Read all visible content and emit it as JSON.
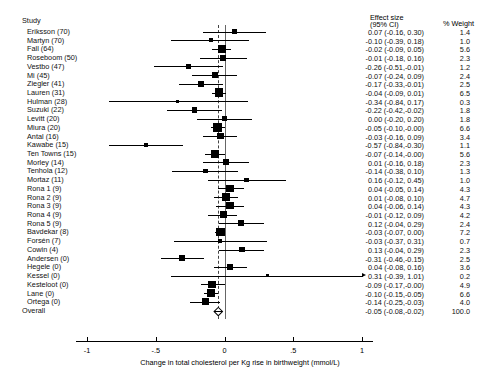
{
  "headers": {
    "study": "Study",
    "effect_size_line1": "Effect size",
    "effect_size_line2": "(95% CI)",
    "weight": "% Weight"
  },
  "axis": {
    "title": "Change in total cholesterol per Kg rise in birthweight (mmol/L)",
    "ticks": [
      "-1",
      "-.5",
      "0",
      ".5",
      "1"
    ],
    "tick_values": [
      -1,
      -0.5,
      0,
      0.5,
      1
    ],
    "xlim": [
      -1.08,
      1.08
    ]
  },
  "overall": {
    "label": "Overall",
    "effect": "-0.05 (-0.08,-0.02)",
    "weight": "100.0"
  },
  "chart_data": {
    "type": "forest",
    "title": "",
    "xlabel": "Change in total cholesterol per Kg rise in birthweight (mmol/L)",
    "ylabel": "",
    "xlim": [
      -1.08,
      1.08
    ],
    "ticks": [
      -1,
      -0.5,
      0,
      0.5,
      1
    ],
    "null_line": 0,
    "pooled_line": -0.05,
    "columns": [
      "Study",
      "Effect size (95% CI)",
      "% Weight"
    ],
    "rows": [
      {
        "study": "Eriksson (70)",
        "est": 0.07,
        "lo": -0.16,
        "hi": 0.3,
        "weight": 1.4,
        "effect": "0.07 (-0.16, 0.30)",
        "weight_label": "1.4"
      },
      {
        "study": "Martyn (70)",
        "est": -0.1,
        "lo": -0.39,
        "hi": 0.18,
        "weight": 1.0,
        "effect": "-0.10 (-0.39, 0.18)",
        "weight_label": "1.0"
      },
      {
        "study": "Fall (64)",
        "est": -0.02,
        "lo": -0.09,
        "hi": 0.05,
        "weight": 5.6,
        "effect": "-0.02 (-0.09, 0.05)",
        "weight_label": "5.6"
      },
      {
        "study": "Roseboom (50)",
        "est": -0.01,
        "lo": -0.18,
        "hi": 0.16,
        "weight": 2.3,
        "effect": "-0.01 (-0.18, 0.16)",
        "weight_label": "2.3"
      },
      {
        "study": "Vestbo (47)",
        "est": -0.26,
        "lo": -0.51,
        "hi": -0.01,
        "weight": 1.2,
        "effect": "-0.26 (-0.51,-0.01)",
        "weight_label": "1.2"
      },
      {
        "study": "Mi (45)",
        "est": -0.07,
        "lo": -0.24,
        "hi": 0.09,
        "weight": 2.4,
        "effect": "-0.07 (-0.24, 0.09)",
        "weight_label": "2.4"
      },
      {
        "study": "Ziegler (41)",
        "est": -0.17,
        "lo": -0.33,
        "hi": -0.01,
        "weight": 2.5,
        "effect": "-0.17 (-0.33,-0.01)",
        "weight_label": "2.5"
      },
      {
        "study": "Lauren (31)",
        "est": -0.04,
        "lo": -0.09,
        "hi": 0.01,
        "weight": 6.5,
        "effect": "-0.04 (-0.09, 0.01)",
        "weight_label": "6.5"
      },
      {
        "study": "Hulman (28)",
        "est": -0.34,
        "lo": -0.84,
        "hi": 0.17,
        "weight": 0.3,
        "effect": "-0.34 (-0.84, 0.17)",
        "weight_label": "0.3"
      },
      {
        "study": "Suzuki (22)",
        "est": -0.22,
        "lo": -0.42,
        "hi": -0.02,
        "weight": 1.8,
        "effect": "-0.22 (-0.42,-0.02)",
        "weight_label": "1.8"
      },
      {
        "study": "Levitt (20)",
        "est": 0.0,
        "lo": -0.2,
        "hi": 0.2,
        "weight": 1.8,
        "effect": "0.00 (-0.20, 0.20)",
        "weight_label": "1.8"
      },
      {
        "study": "Miura (20)",
        "est": -0.05,
        "lo": -0.1,
        "hi": -0.0,
        "weight": 6.6,
        "effect": "-0.05 (-0.10,-0.00)",
        "weight_label": "6.6"
      },
      {
        "study": "Antal (16)",
        "est": -0.03,
        "lo": -0.16,
        "hi": 0.09,
        "weight": 3.4,
        "effect": "-0.03 (-0.16, 0.09)",
        "weight_label": "3.4"
      },
      {
        "study": "Kawabe (15)",
        "est": -0.57,
        "lo": -0.84,
        "hi": -0.3,
        "weight": 1.1,
        "effect": "-0.57 (-0.84,-0.30)",
        "weight_label": "1.1"
      },
      {
        "study": "Ten Towns (15)",
        "est": -0.07,
        "lo": -0.14,
        "hi": -0.0,
        "weight": 5.6,
        "effect": "-0.07 (-0.14,-0.00)",
        "weight_label": "5.6"
      },
      {
        "study": "Morley (14)",
        "est": 0.01,
        "lo": -0.16,
        "hi": 0.18,
        "weight": 2.3,
        "effect": "0.01 (-0.16, 0.18)",
        "weight_label": "2.3"
      },
      {
        "study": "Tenhola (12)",
        "est": -0.14,
        "lo": -0.38,
        "hi": 0.1,
        "weight": 1.3,
        "effect": "-0.14 (-0.38, 0.10)",
        "weight_label": "1.3"
      },
      {
        "study": "Mortaz (11)",
        "est": 0.16,
        "lo": -0.12,
        "hi": 0.45,
        "weight": 1.0,
        "effect": "0.16 (-0.12, 0.45)",
        "weight_label": "1.0"
      },
      {
        "study": "Rona 1 (9)",
        "est": 0.04,
        "lo": -0.05,
        "hi": 0.14,
        "weight": 4.3,
        "effect": "0.04 (-0.05, 0.14)",
        "weight_label": "4.3"
      },
      {
        "study": "Rona 2 (9)",
        "est": 0.01,
        "lo": -0.08,
        "hi": 0.1,
        "weight": 4.7,
        "effect": "0.01 (-0.08, 0.10)",
        "weight_label": "4.7"
      },
      {
        "study": "Rona 3 (9)",
        "est": 0.04,
        "lo": -0.06,
        "hi": 0.14,
        "weight": 4.3,
        "effect": "0.04 (-0.06, 0.14)",
        "weight_label": "4.3"
      },
      {
        "study": "Rona 4 (9)",
        "est": -0.01,
        "lo": -0.12,
        "hi": 0.09,
        "weight": 4.2,
        "effect": "-0.01 (-0.12, 0.09)",
        "weight_label": "4.2"
      },
      {
        "study": "Rona 5 (9)",
        "est": 0.12,
        "lo": -0.04,
        "hi": 0.29,
        "weight": 2.4,
        "effect": "0.12 (-0.04, 0.29)",
        "weight_label": "2.4"
      },
      {
        "study": "Bavdekar (8)",
        "est": -0.03,
        "lo": -0.07,
        "hi": 0.0,
        "weight": 7.2,
        "effect": "-0.03 (-0.07, 0.00)",
        "weight_label": "7.2"
      },
      {
        "study": "Forsén (7)",
        "est": -0.03,
        "lo": -0.37,
        "hi": 0.31,
        "weight": 0.7,
        "effect": "-0.03 (-0.37, 0.31)",
        "weight_label": "0.7"
      },
      {
        "study": "Cowin (4)",
        "est": 0.13,
        "lo": -0.04,
        "hi": 0.29,
        "weight": 2.3,
        "effect": "0.13 (-0.04, 0.29)",
        "weight_label": "2.3"
      },
      {
        "study": "Andersen (0)",
        "est": -0.31,
        "lo": -0.46,
        "hi": -0.15,
        "weight": 2.5,
        "effect": "-0.31 (-0.46,-0.15)",
        "weight_label": "2.5"
      },
      {
        "study": "Hegele (0)",
        "est": 0.04,
        "lo": -0.08,
        "hi": 0.16,
        "weight": 3.6,
        "effect": "0.04 (-0.08, 0.16)",
        "weight_label": "3.6"
      },
      {
        "study": "Kessel (0)",
        "est": 0.31,
        "lo": -0.39,
        "hi": 1.01,
        "weight": 0.2,
        "effect": "0.31 (-0.39, 1.01)",
        "weight_label": "0.2",
        "clipped_right": true
      },
      {
        "study": "Kesteloot (0)",
        "est": -0.09,
        "lo": -0.17,
        "hi": -0.0,
        "weight": 4.9,
        "effect": "-0.09 (-0.17,-0.00)",
        "weight_label": "4.9"
      },
      {
        "study": "Lane (0)",
        "est": -0.1,
        "lo": -0.15,
        "hi": -0.05,
        "weight": 6.6,
        "effect": "-0.10 (-0.15,-0.05)",
        "weight_label": "6.6"
      },
      {
        "study": "Ortega (0)",
        "est": -0.14,
        "lo": -0.25,
        "hi": -0.03,
        "weight": 4.0,
        "effect": "-0.14 (-0.25,-0.03)",
        "weight_label": "4.0"
      },
      {
        "study": "Overall",
        "est": -0.05,
        "lo": -0.08,
        "hi": -0.02,
        "weight": 100.0,
        "effect": "-0.05 (-0.08,-0.02)",
        "weight_label": "100.0",
        "is_summary": true
      }
    ]
  }
}
